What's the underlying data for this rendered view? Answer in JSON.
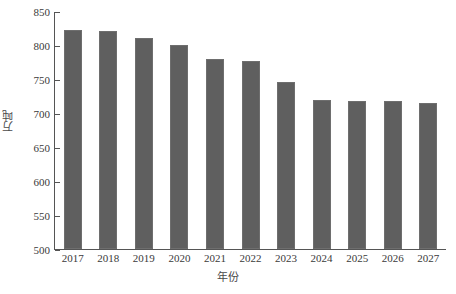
{
  "chart_data": {
    "type": "bar",
    "title": "",
    "subtitle": "",
    "xlabel": "年份",
    "ylabel": "万吨",
    "categories": [
      "2017",
      "2018",
      "2019",
      "2020",
      "2021",
      "2022",
      "2023",
      "2024",
      "2025",
      "2026",
      "2027"
    ],
    "values": [
      822,
      820,
      810,
      800,
      780,
      776,
      746,
      719,
      718,
      717,
      715
    ],
    "series": [
      {
        "name": "万吨",
        "values": [
          822,
          820,
          810,
          800,
          780,
          776,
          746,
          719,
          718,
          717,
          715
        ]
      }
    ],
    "ylim": [
      500,
      850
    ],
    "xlim": null,
    "ytick_labels": [
      "850",
      "800",
      "750",
      "700",
      "650",
      "600",
      "550",
      "500"
    ],
    "ytick_values": [
      850,
      800,
      750,
      700,
      650,
      600,
      550,
      500
    ],
    "ytick_step": 50,
    "grid": false,
    "legend": null,
    "legend_position": "none",
    "bar_color": "#5f5f5f",
    "bar_border_color": "#6e6e6e",
    "axis_color": "#555555",
    "text_color": "#3a3a3a",
    "background": "#ffffff",
    "annotations": []
  }
}
